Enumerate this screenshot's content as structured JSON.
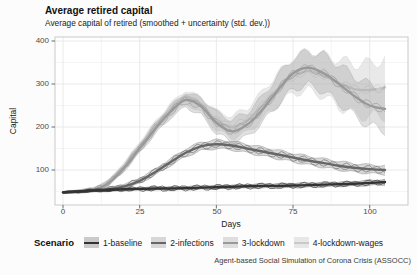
{
  "header": {
    "title": "Average retired capital",
    "subtitle": "Average capital of retired (smoothed + uncertainty (std. dev.))"
  },
  "caption": "Agent-based Social Simulation of Corona Crisis (ASSOCC)",
  "axes": {
    "x": {
      "label": "Days",
      "ticks": [
        "0",
        "25",
        "50",
        "75",
        "100"
      ]
    },
    "y": {
      "label": "Capital",
      "ticks": [
        "400",
        "300",
        "200",
        "100"
      ]
    }
  },
  "legend": {
    "title": "Scenario",
    "items": [
      {
        "label": "1-baseline",
        "line_color": "#333333",
        "fill_color": "rgba(51,51,51,0.25)"
      },
      {
        "label": "2-infections",
        "line_color": "#666666",
        "fill_color": "rgba(102,102,102,0.25)"
      },
      {
        "label": "3-lockdown",
        "line_color": "#999999",
        "fill_color": "rgba(153,153,153,0.30)"
      },
      {
        "label": "4-lockdown-wages",
        "line_color": "#c9c9c9",
        "fill_color": "rgba(201,201,201,0.40)"
      }
    ]
  },
  "style_colors": {
    "panel_border": "#c9c9c9",
    "grid_major": "#e4e4e4",
    "grid_minor": "#f1f1f1",
    "tick_mark": "#4a4a4a",
    "panel_bg": "#ffffff"
  },
  "chart_data": {
    "type": "line",
    "title": "Average retired capital",
    "subtitle": "Average capital of retired (smoothed + uncertainty (std. dev.))",
    "xlabel": "Days",
    "ylabel": "Capital",
    "xlim": [
      0,
      105
    ],
    "y_major_ticks": [
      100,
      200,
      300,
      400
    ],
    "y_minor_ticks": [
      50,
      150,
      250,
      350
    ],
    "x_major_ticks": [
      0,
      25,
      50,
      75,
      100
    ],
    "x_minor_ticks": [
      12.5,
      37.5,
      62.5,
      87.5
    ],
    "grid": "major+minor",
    "legend_position": "bottom",
    "x_days": [
      0,
      5,
      10,
      15,
      20,
      25,
      30,
      35,
      40,
      45,
      50,
      55,
      60,
      65,
      70,
      75,
      80,
      85,
      90,
      95,
      100,
      105
    ],
    "series": [
      {
        "name": "4-lockdown-wages",
        "color": "#c9c9c9",
        "fill": "rgba(201,201,201,0.40)",
        "smoothed": [
          48,
          50,
          54,
          72,
          110,
          155,
          200,
          240,
          270,
          252,
          215,
          200,
          215,
          250,
          288,
          318,
          330,
          320,
          302,
          288,
          286,
          292
        ],
        "std_dev": [
          2,
          4,
          5,
          6,
          8,
          10,
          12,
          14,
          15,
          18,
          22,
          25,
          28,
          32,
          36,
          40,
          44,
          48,
          54,
          58,
          62,
          65
        ],
        "raw_amplitude": 11
      },
      {
        "name": "3-lockdown",
        "color": "#999999",
        "fill": "rgba(153,153,153,0.30)",
        "smoothed": [
          48,
          50,
          54,
          70,
          105,
          150,
          195,
          235,
          263,
          248,
          210,
          190,
          205,
          240,
          285,
          325,
          338,
          325,
          300,
          272,
          250,
          242
        ],
        "std_dev": [
          2,
          4,
          5,
          6,
          8,
          10,
          12,
          14,
          16,
          20,
          24,
          26,
          28,
          30,
          33,
          36,
          40,
          42,
          44,
          46,
          48,
          50
        ],
        "raw_amplitude": 11
      },
      {
        "name": "2-infections",
        "color": "#666666",
        "fill": "rgba(102,102,102,0.25)",
        "smoothed": [
          48,
          50,
          53,
          56,
          62,
          75,
          95,
          118,
          140,
          155,
          160,
          157,
          150,
          143,
          136,
          129,
          122,
          116,
          110,
          105,
          102,
          100
        ],
        "std_dev": [
          2,
          3,
          3,
          4,
          5,
          6,
          7,
          8,
          9,
          10,
          10,
          10,
          10,
          10,
          10,
          10,
          10,
          10,
          10,
          10,
          10,
          10
        ],
        "raw_amplitude": 9
      },
      {
        "name": "1-baseline",
        "color": "#333333",
        "fill": "rgba(51,51,51,0.25)",
        "smoothed": [
          48,
          50,
          52,
          53,
          55,
          56,
          57,
          57,
          58,
          59,
          60,
          61,
          62,
          63,
          63,
          64,
          65,
          66,
          67,
          68,
          70,
          72
        ],
        "std_dev": [
          2,
          2,
          3,
          3,
          3,
          3,
          4,
          4,
          4,
          4,
          4,
          4,
          4,
          5,
          5,
          5,
          5,
          5,
          5,
          5,
          6,
          6
        ],
        "raw_amplitude": 7
      }
    ]
  }
}
